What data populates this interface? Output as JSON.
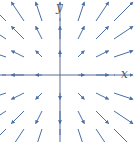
{
  "diagram": {
    "x_label": "x",
    "y_label": "y",
    "grid": [
      -3,
      -2,
      -1,
      0,
      1,
      2,
      3
    ],
    "arrow_color": "#4a6fa5",
    "axis_color": "#5a6d8f"
  }
}
